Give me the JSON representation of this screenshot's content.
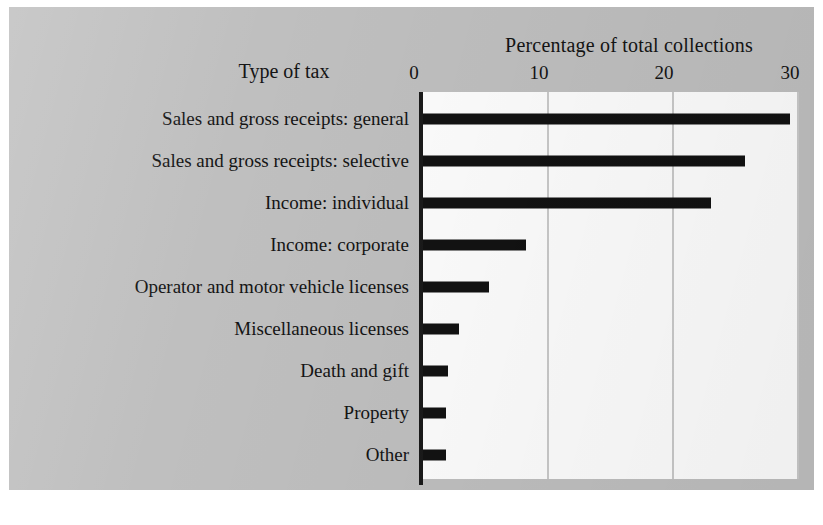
{
  "figure": {
    "background_color": "#bfbfbf",
    "plot_background_color": "#fdfdfd",
    "bar_color": "#121212",
    "gridline_color": "#c9c9c9",
    "axis_color": "#1a1a1a"
  },
  "chart_data": {
    "type": "bar",
    "orientation": "horizontal",
    "title": "Percentage of total collections",
    "xlabel": "Percentage of total collections",
    "ylabel": "Type of tax",
    "xlim": [
      0,
      30
    ],
    "ticks": [
      0,
      10,
      20,
      30
    ],
    "tick_labels": [
      "0",
      "10",
      "20",
      "30"
    ],
    "grid": true,
    "legend": "none",
    "categories": [
      "Sales and gross receipts: general",
      "Sales and gross receipts: selective",
      "Income: individual",
      "Income: corporate",
      "Operator and motor vehicle licenses",
      "Miscellaneous licenses",
      "Death and gift",
      "Property",
      "Other"
    ],
    "values": [
      29.3,
      25.7,
      23.0,
      8.2,
      5.3,
      2.9,
      2.0,
      1.8,
      1.8
    ]
  },
  "axis": {
    "tick_0": "0",
    "tick_10": "10",
    "tick_20": "20",
    "tick_30": "30"
  },
  "labels": {
    "value_axis_title": "Percentage of total collections",
    "category_axis_title": "Type of tax",
    "cat_0": "Sales and gross receipts: general",
    "cat_1": "Sales and gross receipts: selective",
    "cat_2": "Income: individual",
    "cat_3": "Income: corporate",
    "cat_4": "Operator and motor vehicle licenses",
    "cat_5": "Miscellaneous licenses",
    "cat_6": "Death and gift",
    "cat_7": "Property",
    "cat_8": "Other"
  }
}
